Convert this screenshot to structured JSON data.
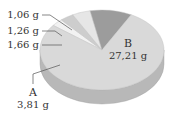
{
  "chart_data": {
    "type": "pie",
    "style": "3d",
    "title": "",
    "slices": [
      {
        "label": "B",
        "value": 27.21,
        "value_text": "27,21 g",
        "color": "#d9d9d9",
        "side_color": "#b8b8b8"
      },
      {
        "label": "A",
        "value": 3.81,
        "value_text": "3,81 g",
        "color": "#9c9c9c",
        "side_color": "#8a8a8a"
      },
      {
        "label": "",
        "value": 1.66,
        "value_text": "1,66 g",
        "color": "#e6e6e6",
        "side_color": "#c8c8c8"
      },
      {
        "label": "",
        "value": 1.26,
        "value_text": "1,26 g",
        "color": "#cdcdcd",
        "side_color": "#b0b0b0"
      },
      {
        "label": "",
        "value": 1.06,
        "value_text": "1,06 g",
        "color": "#f2f2f2",
        "side_color": "#d0d0d0"
      }
    ],
    "unit": "g",
    "legend": "none",
    "labels": {
      "b_name": "B",
      "b_value": "27,21 g",
      "a_name": "A",
      "a_value": "3,81 g",
      "s1": "1,66 g",
      "s2": "1,26 g",
      "s3": "1,06 g"
    }
  }
}
